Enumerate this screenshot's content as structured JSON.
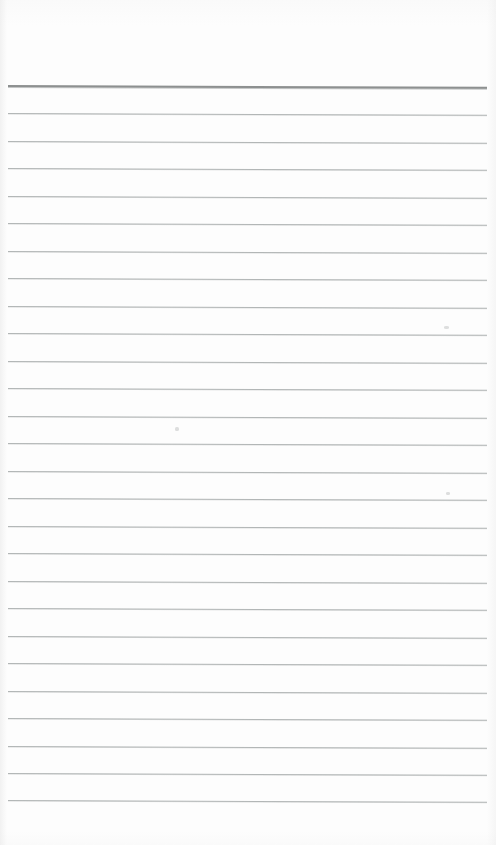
{
  "document": {
    "kind": "scanned-lined-paper",
    "title": "Blank Ruled Notebook Page",
    "page_width": 496,
    "page_height": 845,
    "paper_color": "#fdfdfd",
    "is_blank": "true",
    "handwriting_present": "false",
    "orientation": "portrait"
  },
  "ruling": {
    "style": "wide ruled",
    "line_color": "#b2b6b6",
    "header_line_color": "#8d9090",
    "line_thickness_px": 1,
    "header_line_thickness_px": 2,
    "line_spacing_px": 27.5,
    "total_lines": 27,
    "header_line_count": 1,
    "body_line_count": 26,
    "left_inset_px": 8,
    "right_inset_px": 9,
    "top_margin_px": 85,
    "bottom_margin_px": 45,
    "skew_deg": 0.22,
    "margin_rule_present": "false"
  },
  "lines": [
    {
      "index": 0,
      "y": 85,
      "role": "header"
    },
    {
      "index": 1,
      "y": 113,
      "role": "body"
    },
    {
      "index": 2,
      "y": 140.5,
      "role": "body"
    },
    {
      "index": 3,
      "y": 168,
      "role": "body"
    },
    {
      "index": 4,
      "y": 195.5,
      "role": "body"
    },
    {
      "index": 5,
      "y": 223,
      "role": "body"
    },
    {
      "index": 6,
      "y": 250.5,
      "role": "body"
    },
    {
      "index": 7,
      "y": 278,
      "role": "body"
    },
    {
      "index": 8,
      "y": 305.5,
      "role": "body"
    },
    {
      "index": 9,
      "y": 333,
      "role": "body"
    },
    {
      "index": 10,
      "y": 360.5,
      "role": "body"
    },
    {
      "index": 11,
      "y": 388,
      "role": "body"
    },
    {
      "index": 12,
      "y": 415.5,
      "role": "body"
    },
    {
      "index": 13,
      "y": 443,
      "role": "body"
    },
    {
      "index": 14,
      "y": 470.5,
      "role": "body"
    },
    {
      "index": 15,
      "y": 498,
      "role": "body"
    },
    {
      "index": 16,
      "y": 525.5,
      "role": "body"
    },
    {
      "index": 17,
      "y": 553,
      "role": "body"
    },
    {
      "index": 18,
      "y": 580.5,
      "role": "body"
    },
    {
      "index": 19,
      "y": 608,
      "role": "body"
    },
    {
      "index": 20,
      "y": 635.5,
      "role": "body"
    },
    {
      "index": 21,
      "y": 663,
      "role": "body"
    },
    {
      "index": 22,
      "y": 690.5,
      "role": "body"
    },
    {
      "index": 23,
      "y": 718,
      "role": "body"
    },
    {
      "index": 24,
      "y": 745.5,
      "role": "body"
    },
    {
      "index": 25,
      "y": 773,
      "role": "body"
    },
    {
      "index": 26,
      "y": 800,
      "role": "body"
    }
  ],
  "artifacts": [
    {
      "name": "scan-speck-upper-right",
      "x": 444,
      "y": 326,
      "w": 5,
      "h": 3
    },
    {
      "name": "scan-speck-mid-left",
      "x": 175,
      "y": 427,
      "w": 4,
      "h": 4
    },
    {
      "name": "scan-speck-right-lower",
      "x": 446,
      "y": 492,
      "w": 4,
      "h": 3
    }
  ]
}
